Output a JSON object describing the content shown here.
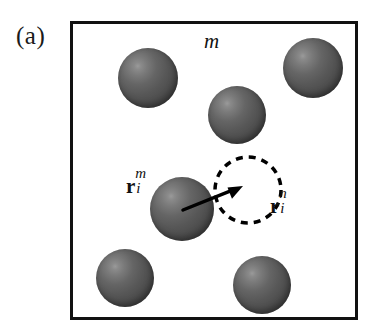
{
  "figure": {
    "panel_label": "(a)",
    "species_label": "m",
    "caption_present": false
  },
  "labels": {
    "origin_vector": {
      "symbol": "r",
      "superscript": "m",
      "subscript": "i",
      "full": "r_i^m"
    },
    "target_vector": {
      "symbol": "r",
      "superscript": "n",
      "subscript": "i",
      "full": "r_i^n"
    }
  },
  "colors": {
    "box_border": "#111111",
    "sphere_dark": "#363636",
    "sphere_mid": "#575757",
    "sphere_highlight": "#9a9a9a",
    "arrow": "#000000",
    "dashed_circle": "#000000",
    "background": "#ffffff"
  },
  "diagram_data": {
    "type": "schematic",
    "description": "Simulation cell of species m containing six shaded spheres; a displacement arrow runs from the centre of the central sphere to a dashed circle marking the trial position of species n.",
    "box": {
      "x": 70,
      "y": 21,
      "width": 288,
      "height": 299,
      "border_width": 3
    },
    "spheres": [
      {
        "id": "sphere-top-left",
        "cx": 148,
        "cy": 78,
        "r": 30
      },
      {
        "id": "sphere-top-right",
        "cx": 313,
        "cy": 68,
        "r": 30
      },
      {
        "id": "sphere-upper-middle",
        "cx": 237,
        "cy": 115,
        "r": 29
      },
      {
        "id": "sphere-center",
        "cx": 182,
        "cy": 209,
        "r": 32
      },
      {
        "id": "sphere-bottom-left",
        "cx": 125,
        "cy": 278,
        "r": 29
      },
      {
        "id": "sphere-bottom-right",
        "cx": 262,
        "cy": 285,
        "r": 29
      }
    ],
    "dashed_circle": {
      "cx": 248,
      "cy": 190,
      "r": 33,
      "dash": 7,
      "gap": 6,
      "stroke_width": 3.5
    },
    "arrow": {
      "x1": 183,
      "y1": 210,
      "x2": 243,
      "y2": 186,
      "stroke_width": 3.5,
      "head_length": 15
    }
  }
}
